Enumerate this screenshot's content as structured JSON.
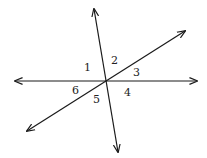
{
  "diagram": {
    "colors": {
      "line": "#1a1a1a",
      "label": "#222222",
      "background": "#ffffff"
    },
    "intersection": {
      "x": 105,
      "y": 81
    },
    "lines": [
      {
        "id": "horizontal",
        "from": {
          "x": 15,
          "y": 81
        },
        "to": {
          "x": 197,
          "y": 81
        }
      },
      {
        "id": "steep",
        "from": {
          "x": 94,
          "y": 9
        },
        "to": {
          "x": 118,
          "y": 152
        }
      },
      {
        "id": "diagonal",
        "from": {
          "x": 27,
          "y": 131
        },
        "to": {
          "x": 185,
          "y": 31
        }
      }
    ],
    "angle_labels": [
      {
        "text": "1",
        "x": 84,
        "y": 71
      },
      {
        "text": "2",
        "x": 111,
        "y": 64
      },
      {
        "text": "3",
        "x": 133,
        "y": 76
      },
      {
        "text": "4",
        "x": 124,
        "y": 96
      },
      {
        "text": "5",
        "x": 93,
        "y": 103
      },
      {
        "text": "6",
        "x": 72,
        "y": 94
      }
    ]
  }
}
